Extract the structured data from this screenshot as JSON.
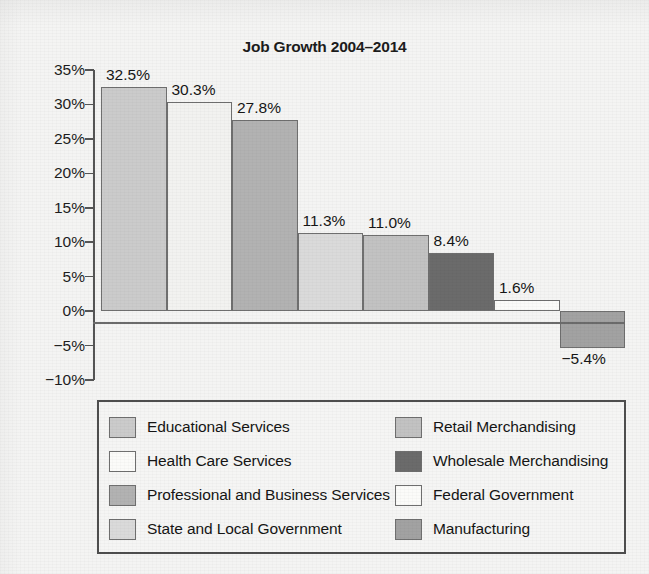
{
  "chart_data": {
    "type": "bar",
    "title": "Job Growth 2004–2014",
    "xlabel": "",
    "ylabel": "",
    "ylim": [
      -10,
      35
    ],
    "ytick_step": 5,
    "ytick_labels": [
      "35%",
      "30%",
      "25%",
      "20%",
      "15%",
      "10%",
      "5%",
      "0%",
      "−5%",
      "−10%"
    ],
    "ytick_values": [
      35,
      30,
      25,
      20,
      15,
      10,
      5,
      0,
      -5,
      -10
    ],
    "grid": false,
    "legend_position": "below",
    "categories": [
      "Educational Services",
      "Health Care Services",
      "Professional and Business Services",
      "State and Local Government",
      "Retail Merchandising",
      "Wholesale Merchandising",
      "Federal Government",
      "Manufacturing"
    ],
    "values": [
      32.5,
      30.3,
      27.8,
      11.3,
      11.0,
      8.4,
      1.6,
      -5.4
    ],
    "value_labels": [
      "32.5%",
      "30.3%",
      "27.8%",
      "11.3%",
      "11.0%",
      "8.4%",
      "1.6%",
      "−5.4%"
    ],
    "bar_colors": [
      "#cbcbcb",
      "#f2f2f0",
      "#b2b2b2",
      "#dadada",
      "#c2c2c2",
      "#6b6b6b",
      "#fbfbf9",
      "#a2a2a2"
    ],
    "bar_edge_color": "#6f6f6f"
  },
  "legend": {
    "columns": [
      {
        "items": [
          {
            "label": "Educational Services",
            "color": "#cbcbcb"
          },
          {
            "label": "Health Care Services",
            "color": "#fbfbf9"
          },
          {
            "label": "Professional and Business Services",
            "color": "#b2b2b2"
          },
          {
            "label": "State and Local Government",
            "color": "#dadada"
          }
        ]
      },
      {
        "items": [
          {
            "label": "Retail Merchandising",
            "color": "#c2c2c2"
          },
          {
            "label": "Wholesale Merchandising",
            "color": "#6b6b6b"
          },
          {
            "label": "Federal Government",
            "color": "#fbfbf9"
          },
          {
            "label": "Manufacturing",
            "color": "#a2a2a2"
          }
        ]
      }
    ]
  }
}
